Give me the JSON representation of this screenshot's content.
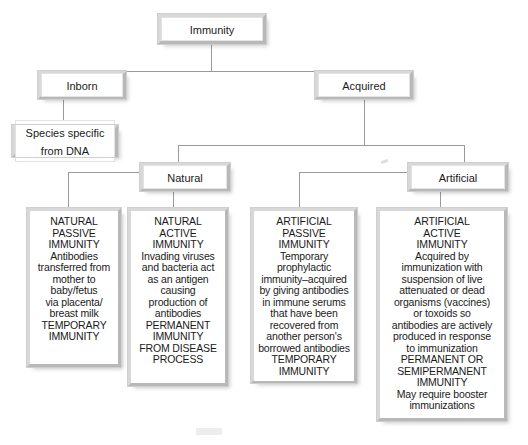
{
  "diagram": {
    "title": "Immunity",
    "type": "hierarchical-flowchart",
    "root": {
      "id": "immunity",
      "label": "Immunity"
    },
    "level2": [
      {
        "id": "inborn",
        "label": "Inborn"
      },
      {
        "id": "acquired",
        "label": "Acquired"
      }
    ],
    "level3": [
      {
        "id": "species",
        "label": "Species specific\nfrom DNA"
      },
      {
        "id": "natural",
        "label": "Natural"
      },
      {
        "id": "artificial",
        "label": "Artificial"
      }
    ],
    "leaves": [
      {
        "id": "natural-passive",
        "heading": "NATURAL\nPASSIVE\nIMMUNITY",
        "body": "Antibodies\ntransferred from\nmother to\nbaby/fetus\nvia placenta/\nbreast milk\nTEMPORARY\nIMMUNITY"
      },
      {
        "id": "natural-active",
        "heading": "NATURAL\nACTIVE\nIMMUNITY",
        "body": "Invading viruses\nand bacteria act\nas an antigen\ncausing\nproduction of\nantibodies\nPERMANENT\nIMMUNITY\nFROM DISEASE\nPROCESS"
      },
      {
        "id": "artificial-passive",
        "heading": "ARTIFICIAL\nPASSIVE\nIMMUNITY",
        "body": "Temporary\nprophylactic\nimmunity–acquired\nby giving antibodies\nin immune serums\nthat have been\nrecovered from\nanother person's\nborrowed antibodies\nTEMPORARY\nIMMUNITY"
      },
      {
        "id": "artificial-active",
        "heading": "ARTIFICIAL\nACTIVE\nIMMUNITY",
        "body": "Acquired by\nimmunization with\nsuspension of live\nattenuated or dead\norganisms (vaccines)\nor toxoids so\nantibodies are actively\nproduced in response\nto immunization\nPERMANENT OR\nSEMIPERMANENT\nIMMUNITY\nMay require booster\nimmunizations"
      }
    ],
    "colors": {
      "background": "#ffffff",
      "box_fill": "#ffffff",
      "bevel_light": "#d8d8d8",
      "bevel_dark": "#b8b8b8",
      "connector": "#9a9a9a",
      "text": "#1a1a1a"
    }
  }
}
